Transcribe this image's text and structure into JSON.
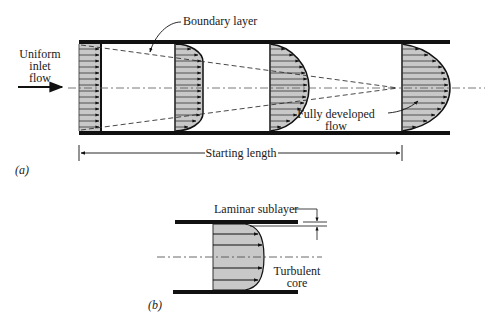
{
  "figure": {
    "part_a": {
      "tag": "(a)",
      "labels": {
        "inlet_line1": "Uniform",
        "inlet_line2": "inlet",
        "inlet_line3": "flow",
        "boundary_layer": "Boundary layer",
        "fully_developed_line1": "Fully developed",
        "fully_developed_line2": "flow",
        "starting_length": "Starting length"
      },
      "profiles": [
        "uniform",
        "developing-1",
        "developing-2",
        "parabolic"
      ]
    },
    "part_b": {
      "tag": "(b)",
      "labels": {
        "laminar_sublayer": "Laminar sublayer",
        "turbulent_line1": "Turbulent",
        "turbulent_line2": "core"
      }
    },
    "colors": {
      "ink": "#111111",
      "fill": "#c8c8c8",
      "dash": "#333333"
    }
  }
}
